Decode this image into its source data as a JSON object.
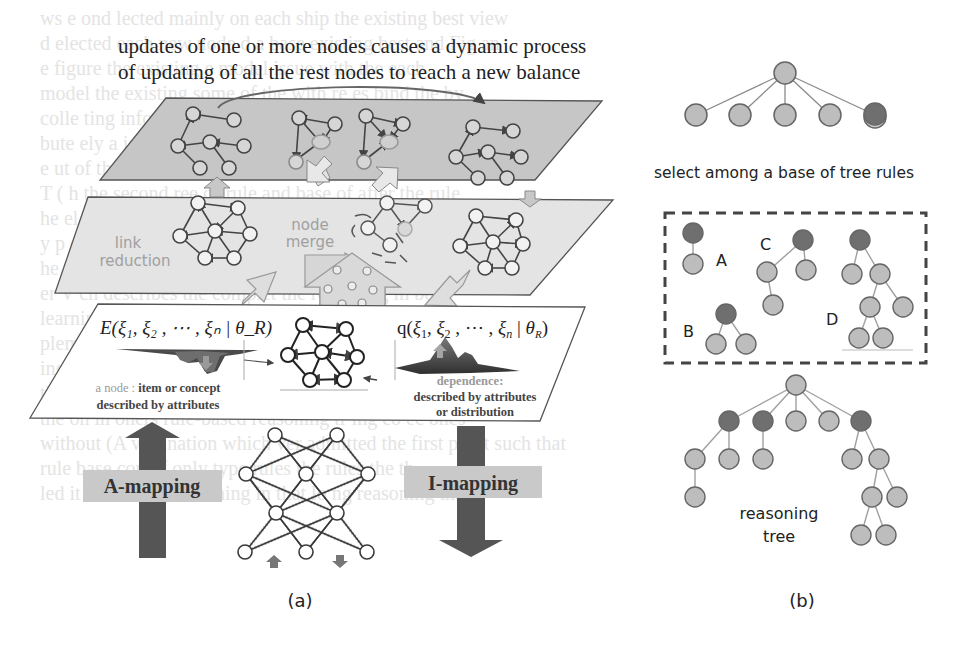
{
  "figure": {
    "title_lines": [
      "updates of one or more nodes causes a dynamic process",
      "of updating of all the rest nodes to reach a new balance"
    ],
    "panel_a": {
      "label": "(a)",
      "layers": {
        "middle": {
          "link_reduction_label_1": "link",
          "link_reduction_label_2": "reduction",
          "node_merge_label_1": "node",
          "node_merge_label_2": "merge"
        },
        "bottom": {
          "energy_formula": "E(ξ₁, ξ₂ , ⋯ , ξₙ | θ_R)",
          "energy_formula_main": "E(ξ",
          "distribution_formula_main": "q(ξ",
          "node_caption_1": "a node :",
          "node_caption_2": " item or concept",
          "node_caption_3": "described by attributes",
          "dependence_caption_1": "dependence:",
          "dependence_caption_2": "described by attributes",
          "dependence_caption_3": "or distribution"
        }
      },
      "a_mapping_label": "A-mapping",
      "i_mapping_label": "I-mapping"
    },
    "panel_b": {
      "label": "(b)",
      "select_caption": "select among a base of tree rules",
      "rule_labels": [
        "A",
        "B",
        "C",
        "D"
      ],
      "reasoning_caption_1": "reasoning",
      "reasoning_caption_2": "tree"
    },
    "colors": {
      "top_layer_fill": "#c9c9c9",
      "middle_layer_fill": "#e3e3e3",
      "node_light": "#bdbdbd",
      "node_dark": "#6f6f6f",
      "arrow_dark": "#4a4a4a",
      "mapping_box": "#c8c8c8",
      "text_gray": "#9a9a9a"
    }
  },
  "bleed_through_text": [
    "ws   e    ond   lected  mainly on each  ship  the  existing  best view",
    "d   elected  each  new node  d   a  base  existing  best  and  Fig  an",
    "    e   figure   the   existing   e   model   issue   with   the  each",
    "model  the  existing   some  of   the   with   re   es   bind   the   by",
    "colle  ting   informations   or   traversal   is   se   e    image   ia",
    "bute   ely  a   ight   ewi   isk   of  the   Model   whole  info   time  is  take",
    "     e  ut  of   the   de  ail   the   se   bution   s   ely",
    "  T  ( h   the  second  ree   ds   rule   and  base  of  after  the  rule",
    "   he   el  of   these   it  ing   eh   ion   se   existing   tree  may",
    "   y  p   ce  of  reasoning   fo   l   the   out",
    "  he   s   nd   a   n   applying   ting   rule   and   thing   in   and",
    "   er   V   ch  describes  the  complet   the   reasoning   in   both",
    "learning   reasoning  to   provide  ing   Y   and   its   rea  soning",
    "   plement   I   lsewa   m   ng  Ap   Ap   so   ch   ind   go",
    "     ing   it   does   ve   to   be   tion   ing   the   also   in   reg",
    "the  the   sy  pri   resulting   to   ru  e   ver   reasoning   imp",
    "the   on  in   oners   rule-based   reasoning   tr   ing   co  ec   ones",
    "without   (A   ver  ination  which  ver   admitted   the   first  point  such  that",
    "rule   base   con   of   only   type   rules   the   rules   the  th",
    "    led   it   in   File   7th   reasoning   in   that   lo   ng   reasoning  that"
  ]
}
